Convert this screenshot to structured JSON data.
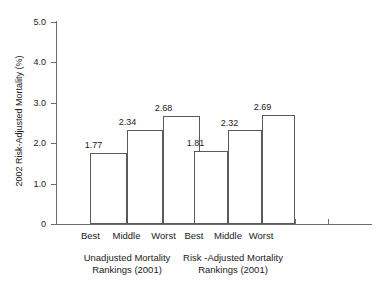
{
  "chart_data": {
    "type": "bar",
    "title": "",
    "xlabel": "",
    "ylabel": "2002 Risk-Adjusted Mortality (%)",
    "ylim": [
      0,
      5.0
    ],
    "ytick_labels": [
      "0",
      "1.0",
      "2.0",
      "3.0",
      "4.0",
      "5.0"
    ],
    "ytick_values": [
      0,
      1.0,
      2.0,
      3.0,
      4.0,
      5.0
    ],
    "grid": false,
    "legend": "none",
    "categories": [
      "Best",
      "Middle",
      "Worst"
    ],
    "groups": [
      {
        "caption_line1": "Unadjusted Mortality",
        "caption_line2": "Rankings (2001)",
        "bars": [
          {
            "category": "Best",
            "value": 1.77,
            "label": "1.77"
          },
          {
            "category": "Middle",
            "value": 2.34,
            "label": "2.34"
          },
          {
            "category": "Worst",
            "value": 2.68,
            "label": "2.68"
          }
        ]
      },
      {
        "caption_line1": "Risk -Adjusted Mortality",
        "caption_line2": "Rankings (2001)",
        "bars": [
          {
            "category": "Best",
            "value": 1.81,
            "label": "1.81"
          },
          {
            "category": "Middle",
            "value": 2.32,
            "label": "2.32"
          },
          {
            "category": "Worst",
            "value": 2.69,
            "label": "2.69"
          }
        ]
      }
    ],
    "colors": {
      "bar_fill": "#ffffff",
      "bar_stroke": "#5a5a5a",
      "axis": "#6b6b6b",
      "text": "#1a1a1a",
      "background": "#ffffff"
    }
  }
}
